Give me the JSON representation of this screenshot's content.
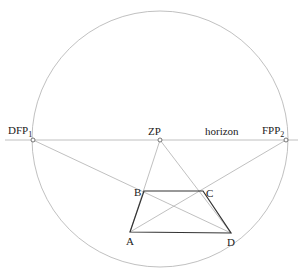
{
  "diagram": {
    "title": "",
    "colors": {
      "background": "#ffffff",
      "thin_line": "#b0b0b0",
      "thick_line": "#333333",
      "text": "#222222"
    },
    "circle": {
      "cx": 160,
      "cy": 139,
      "r": 128
    },
    "horizon": {
      "y": 140,
      "x1": 5,
      "x2": 298,
      "label": "horizon"
    },
    "points": {
      "DFP1": {
        "x": 33,
        "y": 140,
        "label": "DFP",
        "sub": "1"
      },
      "ZP": {
        "x": 160,
        "y": 140,
        "label": "ZP",
        "sub": ""
      },
      "FPP2": {
        "x": 286,
        "y": 140,
        "label": "FPP",
        "sub": "2"
      },
      "A": {
        "x": 130,
        "y": 232,
        "label": "A"
      },
      "B": {
        "x": 144,
        "y": 191,
        "label": "B"
      },
      "C": {
        "x": 203,
        "y": 191,
        "label": "C"
      },
      "D": {
        "x": 231,
        "y": 233,
        "label": "D"
      }
    },
    "construction_lines": [
      [
        "ZP",
        "A"
      ],
      [
        "ZP",
        "D"
      ],
      [
        "DFP1",
        "D"
      ],
      [
        "FPP2",
        "A"
      ]
    ],
    "trapezoid": [
      "A",
      "B",
      "C",
      "D"
    ]
  }
}
